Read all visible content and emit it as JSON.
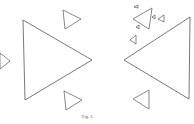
{
  "figure": {
    "caption": "Fig. 3.",
    "stroke_color": "#555555",
    "background": "#ffffff",
    "left_panel": {
      "description": "large right-pointing triangle with three small right-pointing triangles",
      "triangles": [
        {
          "name": "large",
          "points": "23,20 92,60 25,100"
        },
        {
          "name": "small-top-right",
          "points": "63,10 81,19 65,29"
        },
        {
          "name": "small-left",
          "points": "0,53 10,61 0,69"
        },
        {
          "name": "small-bottom-right",
          "points": "64,91 82,100 66,110"
        }
      ]
    },
    "right_panel": {
      "description": "large left-pointing triangle with several small left-pointing triangles clustered top-left",
      "triangles": [
        {
          "name": "large",
          "points": "190,17 124,60 189,99"
        },
        {
          "name": "medium-top",
          "points": "152,8 133,19 149,29"
        },
        {
          "name": "tiny-1",
          "points": "138,5 134,7 138,8"
        },
        {
          "name": "tiny-2",
          "points": "155,15 152,17 155,19"
        },
        {
          "name": "small-3",
          "points": "164,15 158,19 164,22"
        },
        {
          "name": "tiny-4",
          "points": "139,25 136,27 139,29"
        },
        {
          "name": "small-5",
          "points": "136,35 130,40 136,44"
        },
        {
          "name": "small-bottom",
          "points": "149,90 133,99 149,109"
        }
      ]
    }
  }
}
